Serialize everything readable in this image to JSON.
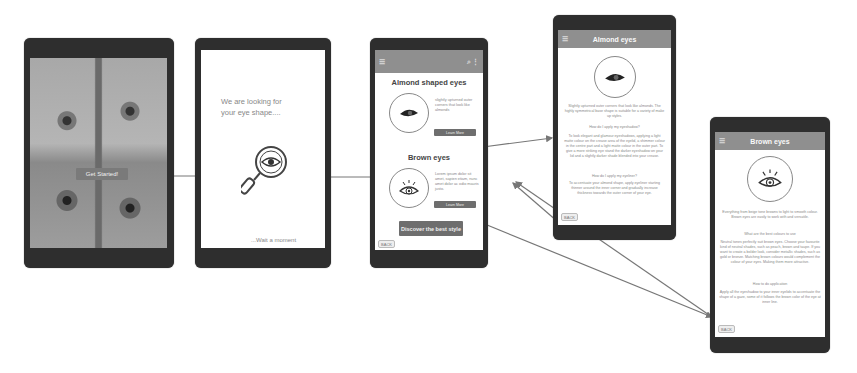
{
  "screens": {
    "start": {
      "button_label": "Get Started!"
    },
    "searching": {
      "heading": "We are looking for your eye shape....",
      "wait_text": "...Wait a moment"
    },
    "results": {
      "icons": {
        "menu": "☰",
        "search": "⌕",
        "more": "⋮"
      },
      "item1": {
        "title": "Almond shaped eyes",
        "description": "slightly upturned outer corners that look like almonds",
        "button_label": "Learn More"
      },
      "item2": {
        "title": "Brown eyes",
        "description": "Lorem ipsum dolor sit amet, sapien etiam, nunc amet dolor ac odio mauris justo.",
        "button_label": "Learn More"
      },
      "cta_label": "Discover the best style",
      "back_label": "BACK"
    },
    "almond_detail": {
      "title": "Almond eyes",
      "intro": "Slightly upturned outer corners that look like almonds. The highly symmetrical base shape is suitable for a variety of make up styles.",
      "subheading1": "How do I apply my eyeshadow?",
      "para1": "To look elegant and glamour eyeshadows, applying a light matte colour on the crease area of the eyelid, a shimmer colour in the centre part and a light matte colour in the outer part. To give a more striking eye stand the darker eyeshadow on your lid and a slightly darker shade blended into your crease.",
      "subheading2": "How do I apply my eyeliner?",
      "para2": "To accentuate your almond shape, apply eyeliner starting thinner around the inner corner and gradually increase thickness towards the outer corner of your eye.",
      "back_label": "BACK"
    },
    "brown_detail": {
      "title": "Brown eyes",
      "intro": "Everything from beige tone browns to light to smooth colour. Brown eyes are easily to work with and versatile.",
      "subheading1": "What are the best colours to use",
      "para1": "Neutral tones perfectly suit brown eyes. Choose your favourite kind of neutral shades, such as peach, brown and taupe. If you want to create a bolder look, consider metallic shades, such as gold or bronze. Matching brown colours would complement the colour of your eyes. Making them more attractive.",
      "subheading2": "How to do application",
      "para2": "Apply all the eyeshadow to your inner eyelids to accentuate the shape of a gaze, some of it follows the brown color of the eye at inner line.",
      "back_label": "BACK"
    }
  }
}
